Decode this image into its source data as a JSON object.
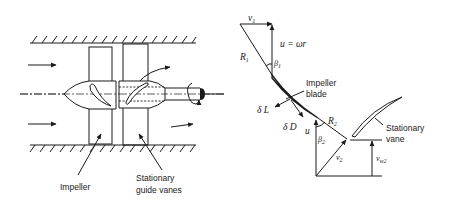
{
  "left_figure": {
    "labels": {
      "impeller": "Impeller",
      "guide_vanes_line1": "Stationary",
      "guide_vanes_line2": "guide vanes"
    }
  },
  "right_figure": {
    "labels": {
      "v1": "v",
      "v1_sub": "1",
      "u_eq": "u = ωr",
      "R1": "R",
      "R1_sub": "1",
      "beta1": "β",
      "beta1_sub": "1",
      "impeller_blade_line1": "Impeller",
      "impeller_blade_line2": "blade",
      "dL": "δ L",
      "dD": "δ D",
      "u2": "u",
      "R2": "R",
      "R2_sub": "2",
      "beta2": "β",
      "beta2_sub": "2",
      "v2": "v",
      "v2_sub": "2",
      "stationary_vane_line1": "Stationary",
      "stationary_vane_line2": "vane",
      "vw2": "v",
      "vw2_sub": "w2"
    }
  },
  "colors": {
    "ink": "#1a1a1a",
    "background": "#ffffff"
  }
}
